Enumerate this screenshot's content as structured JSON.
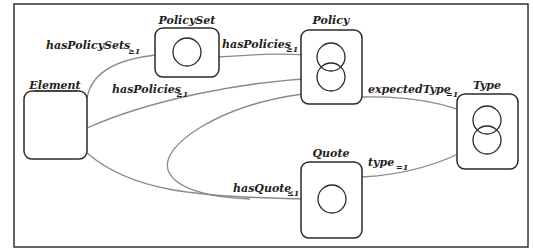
{
  "diagram": {
    "type": "schema-graph",
    "colors": {
      "frame": "#333333",
      "node_border": "#2a2a2a",
      "edge": "#8a8a8a",
      "text": "#222222",
      "background": "#ffffff"
    },
    "nodes": [
      {
        "id": "element",
        "label": "Element",
        "underlined": true,
        "circles": 0
      },
      {
        "id": "policyset",
        "label": "PolicySet",
        "circles": 1
      },
      {
        "id": "policy",
        "label": "Policy",
        "circles": 2
      },
      {
        "id": "quote",
        "label": "Quote",
        "circles": 1
      },
      {
        "id": "type",
        "label": "Type",
        "circles": 2
      }
    ],
    "edges": [
      {
        "from": "element",
        "to": "policyset",
        "label": "hasPolicySets",
        "card": "≥1"
      },
      {
        "from": "policyset",
        "to": "policy",
        "label": "hasPolicies",
        "card": "≥1"
      },
      {
        "from": "element",
        "to": "policy",
        "label": "hasPolicies",
        "card": "≥1"
      },
      {
        "from": "element",
        "to": "quote",
        "label": "hasQuote",
        "card": "≤1"
      },
      {
        "from": "policy",
        "to": "quote",
        "label": "hasQuote",
        "card": "≤1"
      },
      {
        "from": "policy",
        "to": "type",
        "label": "expectedType",
        "card": "=1"
      },
      {
        "from": "quote",
        "to": "type",
        "label": "type",
        "card": "=1"
      }
    ]
  },
  "labels": {
    "element": "Element",
    "policyset": "PolicySet",
    "policy": "Policy",
    "quote": "Quote",
    "type": "Type",
    "e1": "hasPolicySets",
    "e1c": "≥1",
    "e2": "hasPolicies",
    "e2c": "≥1",
    "e3": "hasPolicies",
    "e3c": "≥1",
    "e4": "hasQuote",
    "e4c": "≤1",
    "e5": "expectedType",
    "e5c": "=1",
    "e6": "type",
    "e6c": "=1"
  }
}
